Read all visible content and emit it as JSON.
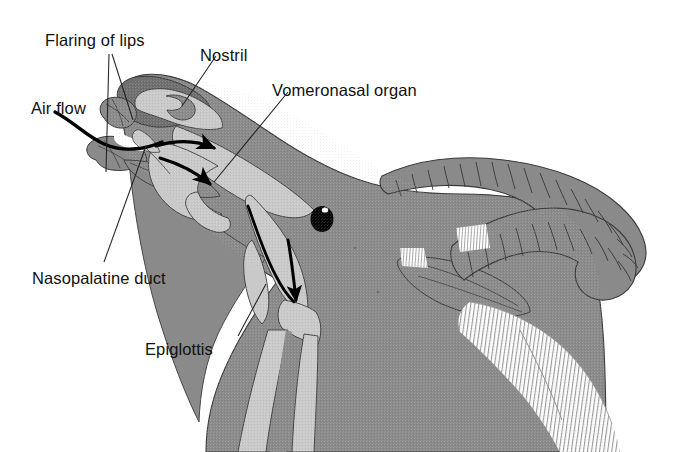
{
  "figure": {
    "background_color": "#ffffff",
    "width": 674,
    "height": 452
  },
  "colors": {
    "tissue_mid_gray": "#8a8a8a",
    "tissue_dark_gray": "#6f6f6f",
    "airway_light_gray": "#c9c9c9",
    "airway_pale_gray": "#d8d8d8",
    "outline": "#3a3a3a",
    "leader_line": "#222222",
    "arrow_black": "#000000",
    "eye_black": "#060606",
    "beard_hatch": "#9a9a9a",
    "label_text": "#111111"
  },
  "labels": [
    {
      "id": "flaring-of-lips",
      "text": "Flaring of lips",
      "x": 45,
      "y": 32
    },
    {
      "id": "nostril",
      "text": "Nostril",
      "x": 200,
      "y": 47
    },
    {
      "id": "vomeronasal-organ",
      "text": "Vomeronasal organ",
      "x": 272,
      "y": 82
    },
    {
      "id": "air-flow",
      "text": "Air flow",
      "x": 31,
      "y": 100
    },
    {
      "id": "nasopalatine-duct",
      "text": "Nasopalatine duct",
      "x": 32,
      "y": 270
    },
    {
      "id": "epiglottis",
      "text": "Epiglottis",
      "x": 145,
      "y": 341
    }
  ],
  "anatomy_parts": [
    {
      "id": "muzzle",
      "name": "Muzzle / flared upper lip"
    },
    {
      "id": "nostril-opening",
      "name": "Nostril opening"
    },
    {
      "id": "nasal-cavity",
      "name": "Nasal cavity airway"
    },
    {
      "id": "vomeronasal-organ",
      "name": "Vomeronasal organ (Jacobson's organ)"
    },
    {
      "id": "nasopalatine-duct",
      "name": "Nasopalatine duct"
    },
    {
      "id": "tongue",
      "name": "Tongue / lower jaw"
    },
    {
      "id": "pharynx",
      "name": "Pharynx"
    },
    {
      "id": "epiglottis",
      "name": "Epiglottis"
    },
    {
      "id": "trachea",
      "name": "Trachea"
    },
    {
      "id": "esophagus",
      "name": "Esophagus"
    },
    {
      "id": "eye",
      "name": "Eye"
    },
    {
      "id": "ear",
      "name": "Ear"
    },
    {
      "id": "horn-near",
      "name": "Near ribbed horn"
    },
    {
      "id": "horn-far",
      "name": "Far ribbed horn"
    },
    {
      "id": "beard",
      "name": "Beard / neck hair hatching"
    }
  ],
  "flow_arrows": [
    {
      "id": "arrow-intake",
      "name": "Air flow intake curve into mouth"
    },
    {
      "id": "arrow-upper-nasal",
      "name": "Arrow into upper nasal passage"
    },
    {
      "id": "arrow-vomeronasal",
      "name": "Arrow into vomeronasal organ"
    },
    {
      "id": "arrow-pharynx",
      "name": "Long arrow sweeping down toward pharynx"
    },
    {
      "id": "arrow-epiglottis",
      "name": "Downward arrow at epiglottis"
    }
  ]
}
